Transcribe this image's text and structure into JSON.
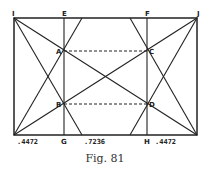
{
  "figure": {
    "caption": "Fig. 81",
    "colors": {
      "ink": "#222222",
      "background": "#ffffff"
    },
    "point_labels": {
      "I": "I",
      "E": "E",
      "F": "F",
      "J": "J",
      "A": "A",
      "C": "C",
      "B": "B",
      "D": "D",
      "G": "G",
      "H": "H"
    },
    "measurements": {
      "left": ".4472",
      "middle": ".7236",
      "right": ".4472"
    }
  }
}
